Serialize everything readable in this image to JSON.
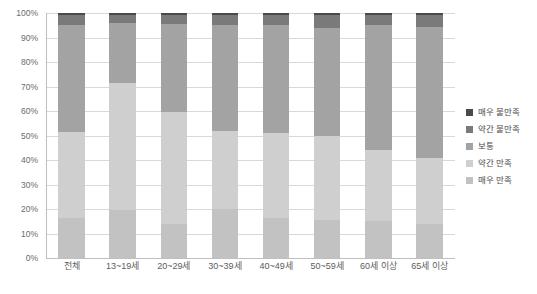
{
  "chart_data": {
    "type": "bar",
    "stacked": true,
    "title": "",
    "xlabel": "",
    "ylabel": "",
    "ylim": [
      0,
      100
    ],
    "grid": true,
    "legend_position": "right",
    "categories": [
      "전체",
      "13~19세",
      "20~29세",
      "30~39세",
      "40~49세",
      "50~59세",
      "60세 이상",
      "65세 이상"
    ],
    "ytick_labels": [
      "0%",
      "10%",
      "20%",
      "30%",
      "40%",
      "50%",
      "60%",
      "70%",
      "80%",
      "90%",
      "100%"
    ],
    "ytick_values": [
      0,
      10,
      20,
      30,
      40,
      50,
      60,
      70,
      80,
      90,
      100
    ],
    "series": [
      {
        "name": "매우 만족",
        "color": "#c2c2c2",
        "values": [
          16.5,
          19.5,
          14.0,
          20.0,
          16.5,
          15.5,
          15.0,
          14.0
        ]
      },
      {
        "name": "약간 만족",
        "color": "#cfcfcf",
        "values": [
          35.0,
          52.0,
          45.5,
          32.0,
          34.5,
          34.5,
          29.0,
          27.0
        ]
      },
      {
        "name": "보통",
        "color": "#a3a3a3",
        "values": [
          43.5,
          24.5,
          36.0,
          43.0,
          44.0,
          44.0,
          51.0,
          53.5
        ]
      },
      {
        "name": "약간 불만족",
        "color": "#7a7a7a",
        "values": [
          4.0,
          3.0,
          3.5,
          4.0,
          4.0,
          5.0,
          4.0,
          4.5
        ]
      },
      {
        "name": "매우 불만족",
        "color": "#4a4a4a",
        "values": [
          1.0,
          1.0,
          1.0,
          1.0,
          1.0,
          1.0,
          1.0,
          1.0
        ]
      }
    ],
    "legend_entries_top_to_bottom": [
      {
        "label": "매우 불만족",
        "color": "#4a4a4a"
      },
      {
        "label": "약간 불만족",
        "color": "#7a7a7a"
      },
      {
        "label": "보통",
        "color": "#a3a3a3"
      },
      {
        "label": "약간 만족",
        "color": "#cfcfcf"
      },
      {
        "label": "매우 만족",
        "color": "#c2c2c2"
      }
    ]
  }
}
